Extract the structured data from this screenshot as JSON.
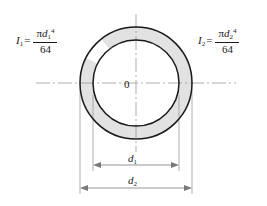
{
  "figure": {
    "background_color": "#ffffff",
    "stroke_color": "#1a1a1a",
    "ring_fill_color": "#e2e2e2",
    "bore_fill_color": "#ffffff",
    "centerline_color": "#9a9a9a",
    "dimension_color": "#7a7a7a"
  },
  "formulas": {
    "left": {
      "symbol": "I",
      "symbol_subscript": "1",
      "equals": "=",
      "numerator_pi": "π",
      "numerator_var": "d",
      "numerator_subscript": "1",
      "numerator_exponent": "4",
      "denominator": "64",
      "plain": "I1 = πd1⁴/64"
    },
    "right": {
      "symbol": "I",
      "symbol_subscript": "2",
      "equals": "=",
      "numerator_pi": "π",
      "numerator_var": "d",
      "numerator_subscript": "2",
      "numerator_exponent": "4",
      "denominator": "64",
      "plain": "I2 = πd2⁴/64"
    }
  },
  "center": {
    "origin_label": "0"
  },
  "dimensions": [
    {
      "name": "inner-diameter",
      "var": "d",
      "subscript": "1",
      "label": "d1",
      "line_y": 165,
      "x_start": 93,
      "x_end": 179
    },
    {
      "name": "outer-diameter",
      "var": "d",
      "subscript": "2",
      "label": "d2",
      "line_y": 188,
      "x_start": 80,
      "x_end": 192
    }
  ],
  "geometry": {
    "center_x": 136,
    "center_y": 83,
    "outer_radius": 56,
    "inner_radius": 43,
    "h_axis_x_start": 36,
    "h_axis_x_end": 236,
    "v_axis_y_start": 14,
    "v_axis_y_end": 152
  }
}
